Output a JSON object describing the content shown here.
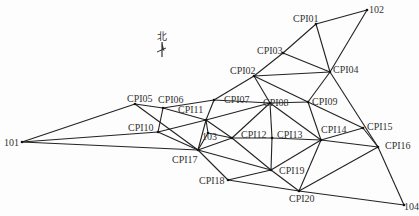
{
  "diagram": {
    "type": "control-network",
    "north_label": "北",
    "nodes": [
      {
        "id": "101",
        "x": 22,
        "y": 142,
        "lx": 4,
        "ly": 146
      },
      {
        "id": "102",
        "x": 367,
        "y": 10,
        "lx": 369,
        "ly": 13
      },
      {
        "id": "103",
        "x": 208,
        "y": 133,
        "lx": 202,
        "ly": 140
      },
      {
        "id": "104",
        "x": 404,
        "y": 205,
        "lx": 404,
        "ly": 210
      },
      {
        "id": "CPI01",
        "x": 316,
        "y": 24,
        "lx": 293,
        "ly": 22
      },
      {
        "id": "CPI02",
        "x": 254,
        "y": 76,
        "lx": 230,
        "ly": 74
      },
      {
        "id": "CPI03",
        "x": 283,
        "y": 53,
        "lx": 257,
        "ly": 54
      },
      {
        "id": "CPI04",
        "x": 330,
        "y": 72,
        "lx": 333,
        "ly": 73
      },
      {
        "id": "CPI05",
        "x": 135,
        "y": 104,
        "lx": 127,
        "ly": 102
      },
      {
        "id": "CPI06",
        "x": 163,
        "y": 108,
        "lx": 158,
        "ly": 103
      },
      {
        "id": "CPI07",
        "x": 214,
        "y": 100,
        "lx": 224,
        "ly": 103
      },
      {
        "id": "CPI08",
        "x": 270,
        "y": 103,
        "lx": 263,
        "ly": 106
      },
      {
        "id": "CPI09",
        "x": 308,
        "y": 102,
        "lx": 312,
        "ly": 105
      },
      {
        "id": "CPI10",
        "x": 158,
        "y": 132,
        "lx": 128,
        "ly": 131
      },
      {
        "id": "CPI11",
        "x": 206,
        "y": 120,
        "lx": 178,
        "ly": 113
      },
      {
        "id": "CPI12",
        "x": 232,
        "y": 138,
        "lx": 241,
        "ly": 138
      },
      {
        "id": "CPI13",
        "x": 272,
        "y": 138,
        "lx": 277,
        "ly": 138
      },
      {
        "id": "CPI14",
        "x": 321,
        "y": 140,
        "lx": 321,
        "ly": 133
      },
      {
        "id": "CPI15",
        "x": 363,
        "y": 128,
        "lx": 367,
        "ly": 130
      },
      {
        "id": "CPI16",
        "x": 378,
        "y": 147,
        "lx": 385,
        "ly": 149
      },
      {
        "id": "CPI17",
        "x": 198,
        "y": 150,
        "lx": 172,
        "ly": 163
      },
      {
        "id": "CPI18",
        "x": 228,
        "y": 180,
        "lx": 199,
        "ly": 184
      },
      {
        "id": "CPI19",
        "x": 271,
        "y": 170,
        "lx": 279,
        "ly": 174
      },
      {
        "id": "CPI20",
        "x": 299,
        "y": 191,
        "lx": 289,
        "ly": 202
      }
    ],
    "edges": [
      [
        "102",
        "CPI01"
      ],
      [
        "102",
        "CPI04"
      ],
      [
        "CPI01",
        "CPI03"
      ],
      [
        "CPI01",
        "CPI04"
      ],
      [
        "CPI03",
        "CPI02"
      ],
      [
        "CPI03",
        "CPI04"
      ],
      [
        "CPI02",
        "CPI04"
      ],
      [
        "CPI02",
        "CPI07"
      ],
      [
        "CPI02",
        "CPI08"
      ],
      [
        "CPI02",
        "CPI09"
      ],
      [
        "CPI04",
        "CPI09"
      ],
      [
        "CPI04",
        "CPI16"
      ],
      [
        "CPI07",
        "CPI06"
      ],
      [
        "CPI07",
        "CPI11"
      ],
      [
        "CPI07",
        "CPI08"
      ],
      [
        "CPI08",
        "CPI09"
      ],
      [
        "CPI08",
        "CPI11"
      ],
      [
        "CPI08",
        "CPI12"
      ],
      [
        "CPI08",
        "CPI13"
      ],
      [
        "CPI08",
        "CPI14"
      ],
      [
        "CPI09",
        "CPI14"
      ],
      [
        "CPI09",
        "CPI15"
      ],
      [
        "CPI05",
        "101"
      ],
      [
        "CPI05",
        "CPI06"
      ],
      [
        "CPI05",
        "CPI17"
      ],
      [
        "CPI06",
        "CPI10"
      ],
      [
        "CPI06",
        "CPI11"
      ],
      [
        "101",
        "CPI10"
      ],
      [
        "101",
        "CPI17"
      ],
      [
        "CPI10",
        "CPI11"
      ],
      [
        "CPI10",
        "CPI17"
      ],
      [
        "CPI11",
        "103"
      ],
      [
        "CPI11",
        "CPI12"
      ],
      [
        "CPI11",
        "CPI17"
      ],
      [
        "103",
        "CPI12"
      ],
      [
        "103",
        "CPI17"
      ],
      [
        "CPI12",
        "CPI13"
      ],
      [
        "CPI12",
        "CPI17"
      ],
      [
        "CPI12",
        "CPI19"
      ],
      [
        "CPI13",
        "CPI14"
      ],
      [
        "CPI13",
        "CPI19"
      ],
      [
        "CPI14",
        "CPI15"
      ],
      [
        "CPI14",
        "CPI16"
      ],
      [
        "CPI14",
        "CPI19"
      ],
      [
        "CPI14",
        "CPI20"
      ],
      [
        "CPI15",
        "CPI16"
      ],
      [
        "CPI16",
        "CPI20"
      ],
      [
        "CPI16",
        "104"
      ],
      [
        "CPI17",
        "CPI18"
      ],
      [
        "CPI17",
        "CPI19"
      ],
      [
        "CPI18",
        "CPI19"
      ],
      [
        "CPI18",
        "CPI20"
      ],
      [
        "CPI19",
        "CPI20"
      ],
      [
        "CPI20",
        "104"
      ]
    ]
  }
}
